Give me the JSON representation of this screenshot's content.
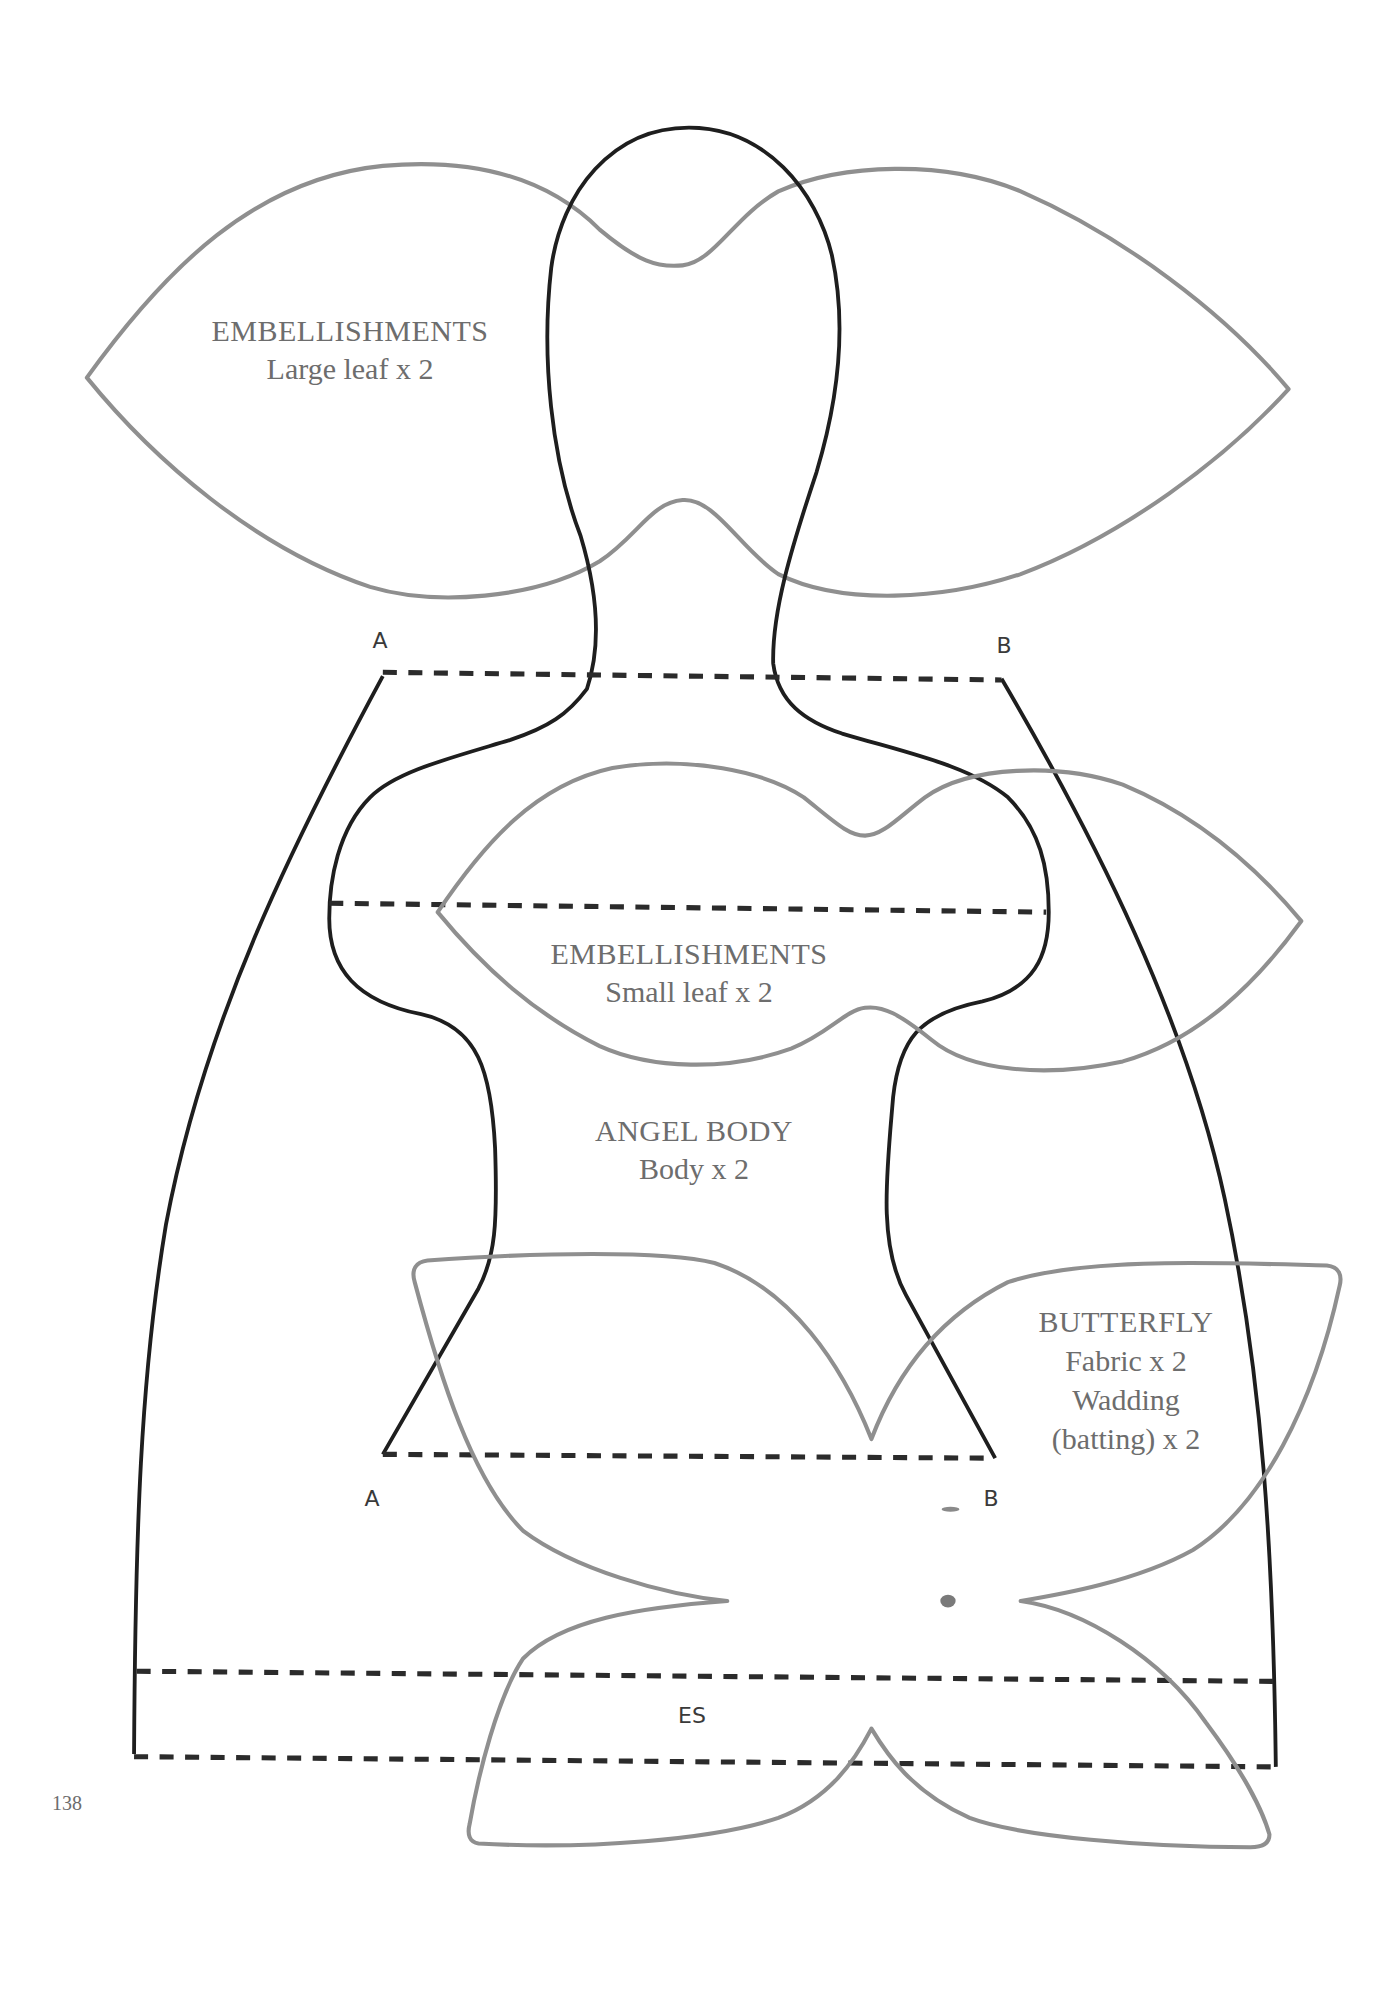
{
  "page_number": "138",
  "pieces": {
    "large_leaf": {
      "title": "EMBELLISHMENTS",
      "instruction": "Large leaf x 2"
    },
    "small_leaf": {
      "title": "EMBELLISHMENTS",
      "instruction": "Small leaf x 2"
    },
    "angel_body": {
      "title": "ANGEL BODY",
      "instruction": "Body x 2"
    },
    "butterfly": {
      "title": "BUTTERFLY",
      "line1": "Fabric x 2",
      "line2": "Wadding",
      "line3": "(batting) x 2"
    }
  },
  "markers": {
    "top_left": "A",
    "top_right": "B",
    "lower_left": "A",
    "lower_right": "B",
    "extension": "ES"
  },
  "colors": {
    "embellishment_outline": "#8f8f8f",
    "body_outline": "#1e1e1e",
    "text": "#6d6d6d"
  }
}
